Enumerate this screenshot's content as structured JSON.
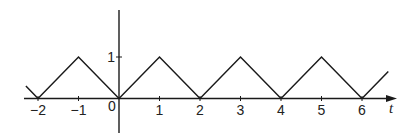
{
  "chart_data": {
    "type": "line",
    "title": "",
    "xlabel": "t",
    "ylabel": "",
    "x": [
      -2.3,
      -2,
      -1,
      0,
      1,
      2,
      3,
      4,
      5,
      6,
      6.65
    ],
    "y": [
      0.3,
      0,
      1,
      0,
      1,
      0,
      1,
      0,
      1,
      0,
      0.65
    ],
    "x_ticks": [
      "-2",
      "-1",
      "0",
      "1",
      "2",
      "3",
      "4",
      "5",
      "6"
    ],
    "y_ticks": [
      "1"
    ],
    "xlim": [
      -2.3,
      6.8
    ],
    "ylim": [
      -0.85,
      2.1
    ],
    "grid": false,
    "legend": null
  },
  "colors": {
    "stroke": "#1a1a1a",
    "background": "#ffffff"
  }
}
